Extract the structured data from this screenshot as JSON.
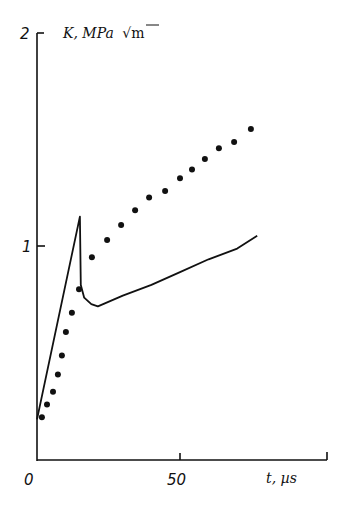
{
  "chart_data": {
    "type": "line",
    "title": "",
    "xlabel": "t, µs",
    "ylabel": "K, MPa √m",
    "xlim": [
      0,
      80
    ],
    "ylim": [
      0,
      2
    ],
    "x_ticks": [
      "0",
      "50"
    ],
    "y_ticks": [
      "1",
      "2"
    ],
    "grid": false,
    "legend": null,
    "series": [
      {
        "name": "solid curve",
        "style": "line",
        "x": [
          0,
          15,
          15.3,
          16.5,
          19,
          21.3,
          30,
          40,
          50,
          60,
          70,
          77
        ],
        "y": [
          0.19,
          1.14,
          0.82,
          0.76,
          0.73,
          0.72,
          0.77,
          0.82,
          0.88,
          0.94,
          0.99,
          1.05
        ]
      },
      {
        "name": "dotted points",
        "style": "markers",
        "x": [
          1.7,
          3.5,
          5.6,
          7.3,
          8.7,
          10.1,
          12.2,
          14.7,
          19.2,
          24.5,
          29.4,
          34.3,
          39.2,
          44.8,
          50.0,
          54.2,
          58.7,
          63.6,
          68.9,
          74.8
        ],
        "y": [
          0.2,
          0.26,
          0.32,
          0.4,
          0.49,
          0.6,
          0.69,
          0.8,
          0.95,
          1.03,
          1.1,
          1.17,
          1.23,
          1.26,
          1.32,
          1.36,
          1.41,
          1.46,
          1.49,
          1.55
        ]
      }
    ]
  },
  "axes": {
    "y_label": "K, MPa",
    "y_label_unit": "√m",
    "x_label": "t, µs",
    "tick_0": "0",
    "tick_50": "50",
    "tick_1": "1",
    "tick_2": "2"
  },
  "plot": {
    "x0_px": 37,
    "x_per_unit": 2.86,
    "y0_px": 460,
    "y_per_unit": 213.5,
    "color": "#111111"
  }
}
